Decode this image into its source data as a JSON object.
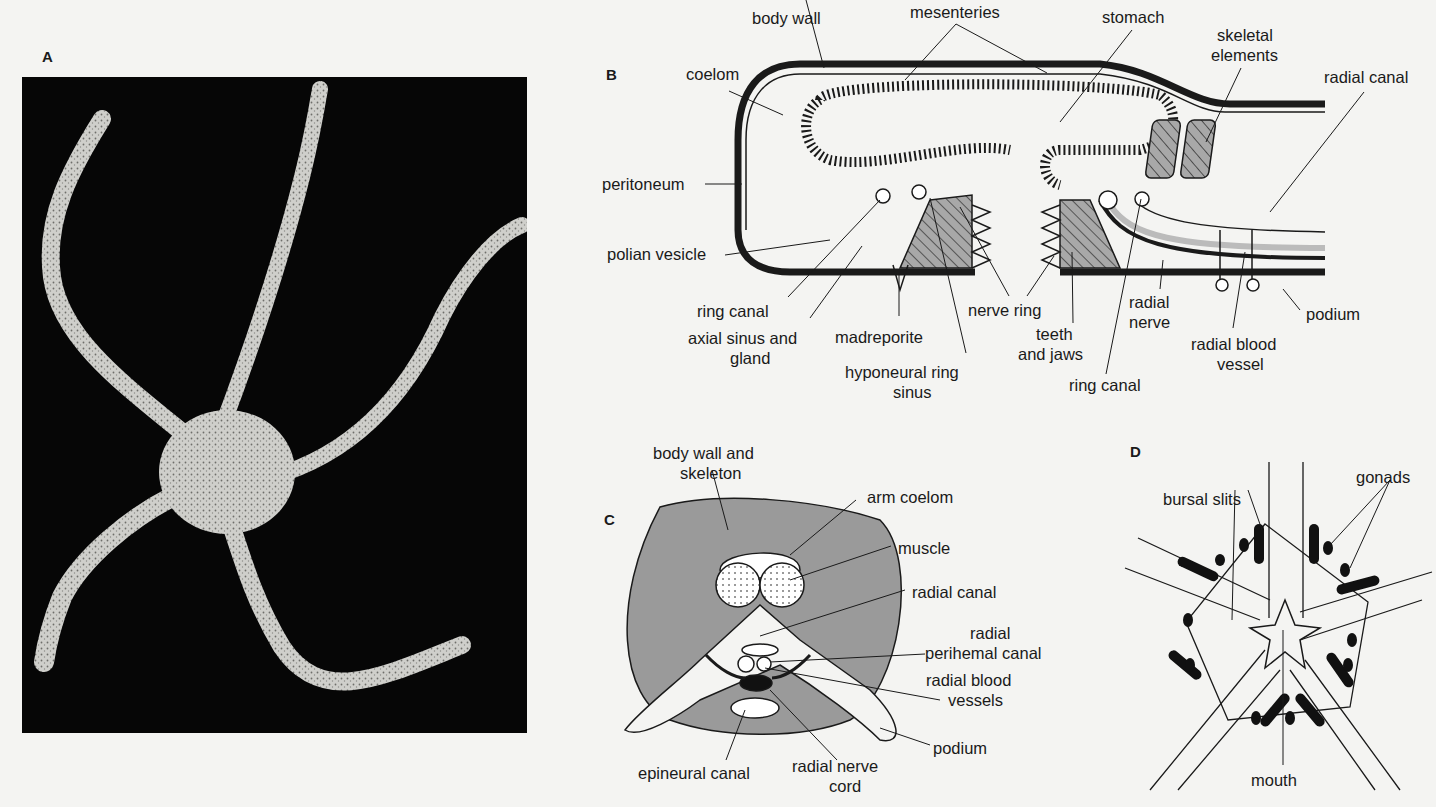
{
  "figure": {
    "panels": {
      "A": {
        "letter": "A",
        "description": "photograph of brittle star with five long slender arms on black background"
      },
      "B": {
        "letter": "B",
        "labels": {
          "body_wall": "body wall",
          "mesenteries": "mesenteries",
          "stomach": "stomach",
          "skeletal_elements_1": "skeletal",
          "skeletal_elements_2": "elements",
          "coelom": "coelom",
          "radial_canal": "radial canal",
          "peritoneum": "peritoneum",
          "polian_vesicle": "polian vesicle",
          "ring_canal_left": "ring canal",
          "axial_sinus_1": "axial sinus and",
          "axial_sinus_2": "gland",
          "madreporite": "madreporite",
          "hyponeural_1": "hyponeural ring",
          "hyponeural_2": "sinus",
          "nerve_ring": "nerve ring",
          "teeth_1": "teeth",
          "teeth_2": "and jaws",
          "ring_canal_right": "ring canal",
          "radial_nerve_1": "radial",
          "radial_nerve_2": "nerve",
          "radial_blood_1": "radial blood",
          "radial_blood_2": "vessel",
          "podium": "podium"
        }
      },
      "C": {
        "letter": "C",
        "labels": {
          "body_wall_1": "body wall and",
          "body_wall_2": "skeleton",
          "arm_coelom": "arm coelom",
          "muscle": "muscle",
          "radial_canal": "radial canal",
          "perihemal_1": "radial",
          "perihemal_2": "perihemal canal",
          "blood_vessels_1": "radial blood",
          "blood_vessels_2": "vessels",
          "podium": "podium",
          "epineural_canal": "epineural canal",
          "nerve_cord_1": "radial nerve",
          "nerve_cord_2": "cord"
        }
      },
      "D": {
        "letter": "D",
        "labels": {
          "bursal_slits": "bursal slits",
          "gonads": "gonads",
          "mouth": "mouth"
        }
      }
    },
    "colors": {
      "page_bg": "#f4f4f2",
      "ink": "#1a1a1a",
      "photo_bg": "#060606",
      "shaded_gray": "#9a9a9a",
      "starfish_light": "#cfcfcb"
    }
  }
}
